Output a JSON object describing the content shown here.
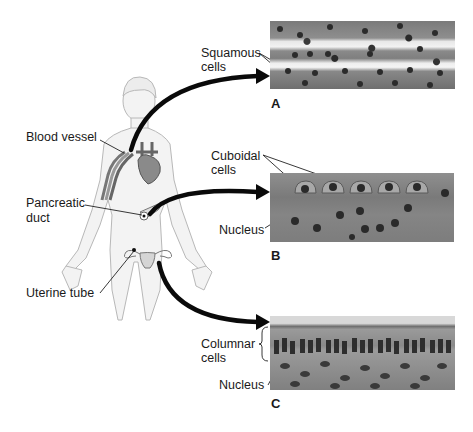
{
  "figure": {
    "left_labels": {
      "blood_vessel": "Blood vessel",
      "pancreatic_duct_line1": "Pancreatic",
      "pancreatic_duct_line2": "duct",
      "uterine_tube": "Uterine tube"
    },
    "panels": [
      {
        "letter": "A",
        "tissue_label_line1": "Squamous",
        "tissue_label_line2": "cells"
      },
      {
        "letter": "B",
        "tissue_label_line1": "Cuboidal",
        "tissue_label_line2": "cells",
        "nucleus_label": "Nucleus"
      },
      {
        "letter": "C",
        "tissue_label_line1": "Columnar",
        "tissue_label_line2": "cells",
        "nucleus_label": "Nucleus"
      }
    ],
    "colors": {
      "arrow": "#0a0a0a",
      "body_fill": "#f2f2f2",
      "body_outline": "#b5b5b5",
      "organ_fill": "#9a9a9a",
      "micro_bg": "#8c8c8c",
      "nucleus": "#2a2a2a"
    }
  }
}
